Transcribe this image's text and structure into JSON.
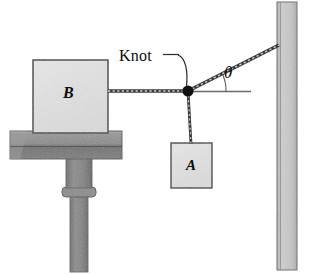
{
  "figure": {
    "background_color": "#ffffff",
    "width": 312,
    "height": 275
  },
  "labels": {
    "knot": "Knot",
    "theta": "θ",
    "block_b": "B",
    "block_a": "A"
  },
  "colors": {
    "block_fill": "#e2e2e2",
    "block_stroke": "#4a4a4a",
    "table_slab": "#8e8e8e",
    "table_slab_dark": "#6f6f6f",
    "table_column": "#7d7d7d",
    "wall_fill": "#c2c2c2",
    "wall_stroke": "#6b6b6b",
    "rope": "#3a3a3a",
    "knot_dot": "#111111",
    "reference_line": "#6a6a6a",
    "leader_line": "#2a2a2a",
    "text": "#0d0d0d"
  },
  "geometry": {
    "knot_point": {
      "x": 188,
      "y": 91
    },
    "knot_dot_radius": 5.5,
    "block_b": {
      "x": 33,
      "y": 60,
      "width": 75,
      "height": 73
    },
    "block_a": {
      "x": 171,
      "y": 143,
      "width": 41,
      "height": 45
    },
    "wall": {
      "x": 277,
      "y": 2,
      "width": 20,
      "height": 268
    },
    "wall_anchor": {
      "x": 278,
      "y": 45
    },
    "table_slab": {
      "x": 10,
      "y": 131,
      "width": 112,
      "height": 28
    },
    "table_column_upper": {
      "x": 66,
      "y": 159,
      "width": 26,
      "height": 29
    },
    "table_collar": {
      "x": 63,
      "y": 188,
      "width": 32,
      "height": 9
    },
    "table_shaft": {
      "x": 70,
      "y": 197,
      "width": 18,
      "height": 75
    },
    "horizontal_reference": {
      "x1": 188,
      "y1": 91,
      "x2": 251,
      "y2": 91
    },
    "cord_b_to_knot": {
      "x1": 108,
      "y1": 91,
      "x2": 188,
      "y2": 91
    },
    "cord_knot_to_a": {
      "x1": 188,
      "y1": 91,
      "x2": 191,
      "y2": 143
    },
    "cord_knot_to_wall": {
      "x1": 188,
      "y1": 91,
      "x2": 278,
      "y2": 45
    },
    "theta_arc_radius": 38,
    "leader": {
      "from_x": 178,
      "from_y": 57,
      "to_x": 186,
      "to_y": 86
    }
  },
  "annotations": {
    "angle_name": "theta",
    "angle_between": "cord-to-wall and horizontal reference",
    "knot_points_to": "junction of three cords"
  }
}
